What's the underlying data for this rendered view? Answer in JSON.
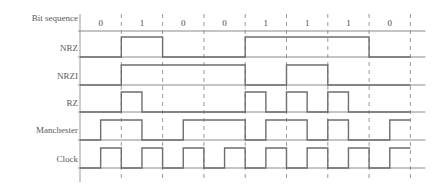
{
  "diagram": {
    "bit_sequence_label": "Bit sequence",
    "bits": [
      "0",
      "1",
      "0",
      "0",
      "1",
      "1",
      "1",
      "0"
    ],
    "row_labels": [
      "Bit sequence",
      "NRZ",
      "NRZI",
      "RZ",
      "Manchester",
      "Clock"
    ],
    "colors": {
      "waveform": "#6e6e6e",
      "baseline": "#8a8a8a",
      "gridline": "#9a9a9a",
      "text": "#4a4a4a",
      "background": "#ffffff"
    }
  },
  "chart_data": {
    "type": "line",
    "xlabel": "",
    "ylabel": "",
    "categories": [
      "0",
      "1",
      "0",
      "0",
      "1",
      "1",
      "1",
      "0"
    ],
    "x": [
      1,
      2,
      3,
      4,
      5,
      6,
      7,
      8
    ],
    "grid": true,
    "legend": "none",
    "axis_notes": "Dashed vertical gridlines mark bit-cell boundaries; each signal plotted as binary level (0 = low baseline, 1 = high).",
    "series": [
      {
        "name": "NRZ",
        "description": "Level is high for a 1 bit and low for a 0 bit, held for the whole bit cell.",
        "values": [
          0,
          1,
          0,
          0,
          1,
          1,
          1,
          0
        ],
        "levels_per_half_bit": [
          0,
          0,
          1,
          1,
          0,
          0,
          0,
          0,
          1,
          1,
          1,
          1,
          1,
          1,
          0,
          0
        ]
      },
      {
        "name": "NRZI",
        "description": "Level inverts at the start of every 1 bit; no change for a 0 bit. Starts low.",
        "values": [
          0,
          1,
          1,
          1,
          0,
          1,
          0,
          0
        ],
        "levels_per_half_bit": [
          0,
          0,
          1,
          1,
          1,
          1,
          1,
          1,
          0,
          0,
          1,
          1,
          0,
          0,
          0,
          0
        ]
      },
      {
        "name": "RZ",
        "description": "A 1 bit is a pulse high for the first half of the cell then returns to zero; a 0 bit stays low.",
        "values": [
          0,
          1,
          0,
          0,
          1,
          1,
          1,
          0
        ],
        "levels_per_half_bit": [
          0,
          0,
          1,
          0,
          0,
          0,
          0,
          0,
          1,
          0,
          1,
          0,
          1,
          0,
          0,
          0
        ]
      },
      {
        "name": "Manchester",
        "description": "Each bit cell carries a mid-cell transition; drawn here half a bit offset so pulses straddle the boundaries.",
        "levels_per_half_bit": [
          0,
          1,
          1,
          0,
          0,
          1,
          1,
          1,
          0,
          1,
          1,
          0,
          1,
          0,
          0,
          1
        ]
      },
      {
        "name": "Clock",
        "description": "One square pulse per bit cell, offset half a bit from the cell boundaries.",
        "levels_per_half_bit": [
          0,
          1,
          0,
          1,
          0,
          1,
          0,
          1,
          0,
          1,
          0,
          1,
          0,
          1,
          0,
          1
        ]
      }
    ]
  }
}
